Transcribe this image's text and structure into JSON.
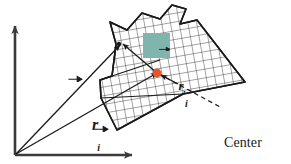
{
  "figure": {
    "type": "physics-vector-diagram",
    "colors": {
      "line": "#1a1a1a",
      "axis": "#3a3a3a",
      "hatch": "#2b2b2b",
      "center_of_mass_marker": "#e8552a",
      "highlight_box": "#7fb5ad",
      "background": "#ffffff"
    }
  },
  "labels": {
    "r_i": {
      "symbol": "r",
      "subscript": "i",
      "prime": "",
      "full": "r_i",
      "description": "position vector of particle i from origin"
    },
    "R": {
      "symbol": "R",
      "subscript": "",
      "prime": "",
      "full": "R",
      "description": "position vector of center of mass from origin"
    },
    "r_i_prime": {
      "symbol": "r",
      "subscript": "i",
      "prime": "′",
      "full": "r_i'",
      "description": "position vector of particle i relative to center of mass"
    },
    "center_of_mass": {
      "line1": "Center",
      "line2": "of Mass"
    }
  },
  "geometry": {
    "origin": {
      "x": 15,
      "y": 155
    },
    "x_axis_tip": {
      "x": 132,
      "y": 155
    },
    "y_axis_tip": {
      "x": 15,
      "y": 26
    },
    "particle_point": {
      "x": 120,
      "y": 45
    },
    "center_of_mass_point": {
      "x": 157,
      "y": 73
    },
    "body_tip_right": {
      "x": 245,
      "y": 82
    },
    "body_bottom": {
      "x": 117,
      "y": 130
    }
  },
  "elements": {
    "x_axis": "horizontal-axis-arrow",
    "y_axis": "vertical-axis-arrow",
    "body": "hatched-rigid-body",
    "leader": "dashed-leader-line"
  }
}
